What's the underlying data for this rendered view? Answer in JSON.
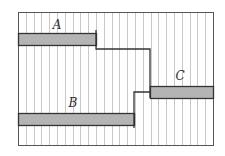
{
  "diagram": {
    "frame": {
      "x": 18,
      "y": 12,
      "width": 195,
      "height": 133,
      "stroke": "#555555"
    },
    "stripes": {
      "spacing": 7.8,
      "color": "#c8c8c8"
    },
    "colors": {
      "bar_fill": "#b4b4b4",
      "line": "#333333"
    },
    "bars": [
      {
        "id": "A",
        "label": "A",
        "x": 18,
        "y": 33,
        "width": 78,
        "height": 12,
        "label_x": 57,
        "label_y": 29
      },
      {
        "id": "B",
        "label": "B",
        "x": 18,
        "y": 113,
        "width": 116,
        "height": 12,
        "label_x": 73,
        "label_y": 107
      },
      {
        "id": "C",
        "label": "C",
        "x": 150,
        "y": 86,
        "width": 63,
        "height": 12,
        "label_x": 180,
        "label_y": 80
      }
    ],
    "step_paths": [
      {
        "id": "A-to-C",
        "points": "96,30 96,49 150,49 150,98"
      },
      {
        "id": "B-to-C",
        "points": "134,128 134,92 150,92"
      }
    ]
  }
}
